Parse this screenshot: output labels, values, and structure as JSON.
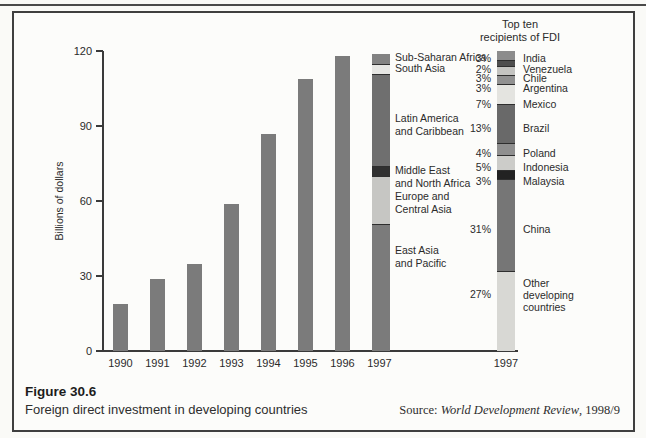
{
  "figure": {
    "number": "Figure 30.6",
    "caption": "Foreign direct investment in developing countries",
    "source_prefix": "Source: ",
    "source_title": "World Development Review",
    "source_suffix": ", 1998/9"
  },
  "chart_data": {
    "type": "bar",
    "ylabel": "Billions of dollars",
    "ylim": [
      0,
      120
    ],
    "yticks": [
      0,
      30,
      60,
      90,
      120
    ],
    "grid": false,
    "bar_color": "#7b7b7b",
    "years_series": {
      "categories": [
        "1990",
        "1991",
        "1992",
        "1993",
        "1994",
        "1995",
        "1996",
        "1997"
      ],
      "values": [
        19,
        29,
        35,
        59,
        87,
        109,
        118,
        119
      ]
    },
    "stacked_1997_regions": {
      "category": "1997",
      "note": "1997 bar is stacked by region; values in billions of dollars, listed top to bottom",
      "segments": [
        {
          "label": "Sub-Saharan Africa",
          "lines": [
            "Sub-Saharan Africa"
          ],
          "value": 4,
          "color": "#828282"
        },
        {
          "label": "South Asia",
          "lines": [
            "South Asia"
          ],
          "value": 4,
          "color": "#e6e6e3"
        },
        {
          "label": "Latin America and Caribbean",
          "lines": [
            "Latin America",
            "and Caribbean"
          ],
          "value": 37,
          "color": "#6f6f6f"
        },
        {
          "label": "Middle East and North Africa",
          "lines": [
            "Middle East",
            "and North Africa"
          ],
          "value": 4,
          "color": "#303030"
        },
        {
          "label": "Europe and Central Asia",
          "lines": [
            "Europe and",
            "Central Asia"
          ],
          "value": 19,
          "color": "#c6c6c3"
        },
        {
          "label": "East Asia and Pacific",
          "lines": [
            "East Asia",
            "and Pacific"
          ],
          "value": 51,
          "color": "#7b7b7b"
        }
      ]
    },
    "top_ten_bar": {
      "title_lines": [
        "Top ten",
        "recipients of FDI"
      ],
      "category": "1997",
      "note": "shares of FDI to developing countries, listed top to bottom",
      "segments": [
        {
          "label": "India",
          "lines": [
            "India"
          ],
          "pct": 3,
          "color": "#8c8c8c"
        },
        {
          "label": "Venezuela",
          "lines": [
            "Venezuela"
          ],
          "pct": 2,
          "color": "#4e4e4e"
        },
        {
          "label": "Chile",
          "lines": [
            "Chile"
          ],
          "pct": 3,
          "color": "#c4c4c1"
        },
        {
          "label": "Argentina",
          "lines": [
            "Argentina"
          ],
          "pct": 3,
          "color": "#919191"
        },
        {
          "label": "Mexico",
          "lines": [
            "Mexico"
          ],
          "pct": 7,
          "color": "#e4e4e0"
        },
        {
          "label": "Brazil",
          "lines": [
            "Brazil"
          ],
          "pct": 13,
          "color": "#696969"
        },
        {
          "label": "Poland",
          "lines": [
            "Poland"
          ],
          "pct": 4,
          "color": "#8f8f8f"
        },
        {
          "label": "Indonesia",
          "lines": [
            "Indonesia"
          ],
          "pct": 5,
          "color": "#ccccc9"
        },
        {
          "label": "Malaysia",
          "lines": [
            "Malaysia"
          ],
          "pct": 3,
          "color": "#222222"
        },
        {
          "label": "China",
          "lines": [
            "China"
          ],
          "pct": 31,
          "color": "#767676"
        },
        {
          "label": "Other developing countries",
          "lines": [
            "Other",
            "developing",
            "countries"
          ],
          "pct": 27,
          "color": "#d8d8d4"
        }
      ]
    }
  }
}
